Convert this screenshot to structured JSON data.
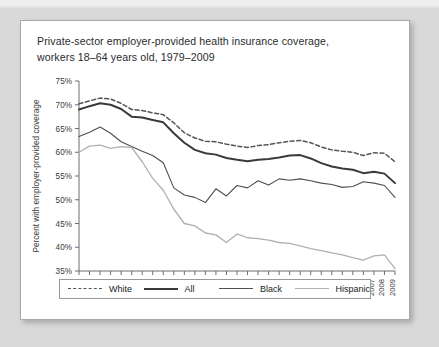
{
  "card": {
    "title_line1": "Private-sector employer-provided health insurance coverage,",
    "title_line2": "workers 18–64 years old, 1979–2009"
  },
  "legend": {
    "items": [
      {
        "label": "White",
        "style": "dashed",
        "color": "#555555",
        "width": 1.5
      },
      {
        "label": "All",
        "style": "solid",
        "color": "#3a3a3a",
        "width": 2.0
      },
      {
        "label": "Black",
        "style": "solid",
        "color": "#4e4e4e",
        "width": 1.1
      },
      {
        "label": "Hispanic",
        "style": "solid",
        "color": "#b0b0b0",
        "width": 1.3
      }
    ]
  },
  "chart_data": {
    "type": "line",
    "title": "Private-sector employer-provided health insurance coverage, workers 18–64 years old, 1979–2009",
    "xlabel": "",
    "ylabel": "Percent with employer-provided coverage",
    "xlim": [
      1979,
      2009
    ],
    "ylim": [
      35,
      75
    ],
    "ytick_labels": [
      "75%",
      "70%",
      "65%",
      "60%",
      "55%",
      "50%",
      "45%",
      "40%",
      "35%"
    ],
    "yticks": [
      75,
      70,
      65,
      60,
      55,
      50,
      45,
      40,
      35
    ],
    "grid": false,
    "legend_position": "bottom",
    "x": [
      1979,
      1980,
      1981,
      1982,
      1983,
      1984,
      1985,
      1986,
      1987,
      1988,
      1989,
      1990,
      1991,
      1992,
      1993,
      1994,
      1995,
      1996,
      1997,
      1998,
      1999,
      2000,
      2001,
      2002,
      2003,
      2004,
      2005,
      2006,
      2007,
      2008,
      2009
    ],
    "categories": [
      "1979",
      "1980",
      "1981",
      "1982",
      "1983",
      "1984",
      "1985",
      "1986",
      "1987",
      "1988",
      "1989",
      "1990",
      "1991",
      "1992",
      "1993",
      "1994",
      "1995",
      "1996",
      "1997",
      "1998",
      "1999",
      "2000",
      "2001",
      "2002",
      "2003",
      "2004",
      "2005",
      "2006",
      "2007",
      "2008",
      "2009"
    ],
    "series": [
      {
        "name": "White",
        "values": [
          70.2,
          70.8,
          71.4,
          71.2,
          70.3,
          69.0,
          68.8,
          68.3,
          67.9,
          66.2,
          64.1,
          63.0,
          62.3,
          62.2,
          61.7,
          61.3,
          61.0,
          61.4,
          61.6,
          62.0,
          62.3,
          62.5,
          62.0,
          61.1,
          60.5,
          60.2,
          60.0,
          59.3,
          59.9,
          59.8,
          58.0
        ]
      },
      {
        "name": "All",
        "values": [
          69.0,
          69.7,
          70.3,
          70.0,
          69.1,
          67.5,
          67.3,
          66.8,
          66.3,
          64.0,
          62.0,
          60.5,
          59.8,
          59.5,
          58.8,
          58.4,
          58.1,
          58.4,
          58.6,
          58.9,
          59.3,
          59.4,
          58.7,
          57.7,
          57.0,
          56.6,
          56.3,
          55.6,
          55.9,
          55.5,
          53.5
        ]
      },
      {
        "name": "Black",
        "values": [
          63.3,
          64.2,
          65.3,
          64.0,
          62.2,
          61.2,
          60.2,
          59.3,
          57.8,
          52.5,
          51.0,
          50.5,
          49.4,
          52.3,
          50.8,
          53.0,
          52.5,
          54.0,
          53.1,
          54.4,
          54.1,
          54.4,
          54.0,
          53.5,
          53.2,
          52.6,
          52.8,
          53.8,
          53.5,
          53.0,
          50.5
        ]
      },
      {
        "name": "Hispanic",
        "values": [
          60.0,
          61.3,
          61.5,
          60.8,
          61.2,
          61.0,
          58.0,
          54.5,
          52.0,
          48.0,
          45.0,
          44.5,
          43.0,
          42.6,
          41.0,
          42.8,
          42.0,
          41.8,
          41.5,
          41.0,
          40.8,
          40.3,
          39.7,
          39.3,
          38.8,
          38.4,
          37.8,
          37.3,
          38.2,
          38.4,
          35.5
        ]
      }
    ]
  }
}
